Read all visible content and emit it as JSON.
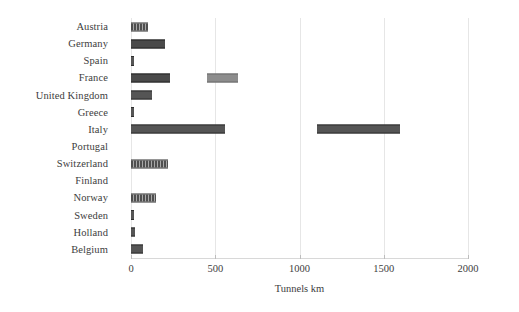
{
  "chart_data": {
    "type": "bar",
    "orientation": "horizontal",
    "title": "",
    "xlabel": "Tunnels km",
    "ylabel": "",
    "xlim": [
      0,
      2000
    ],
    "xticks": [
      0,
      500,
      1000,
      1500,
      2000
    ],
    "xtick_labels": [
      "0",
      "500",
      "1000",
      "1500",
      "2000"
    ],
    "grid": true,
    "grid_axis": "x",
    "legend": "none",
    "categories": [
      "Austria",
      "Germany",
      "Spain",
      "France",
      "United Kingdom",
      "Greece",
      "Italy",
      "Portugal",
      "Switzerland",
      "Finland",
      "Norway",
      "Sweden",
      "Holland",
      "Belgium"
    ],
    "values": [
      100,
      200,
      15,
      635,
      125,
      15,
      1596,
      0,
      220,
      0,
      150,
      15,
      25,
      70
    ],
    "bars": [
      {
        "category": "Austria",
        "total": 100,
        "segments": [
          {
            "start": 0,
            "end": 100,
            "style": "hatch"
          }
        ]
      },
      {
        "category": "Germany",
        "total": 200,
        "segments": [
          {
            "start": 0,
            "end": 200,
            "style": "dark"
          }
        ]
      },
      {
        "category": "Spain",
        "total": 15,
        "segments": [
          {
            "start": 0,
            "end": 15,
            "style": "mid"
          }
        ]
      },
      {
        "category": "France",
        "total": 635,
        "segments": [
          {
            "start": 0,
            "end": 232,
            "style": "dark"
          },
          {
            "start": 451,
            "end": 635,
            "style": "light"
          }
        ]
      },
      {
        "category": "United Kingdom",
        "total": 125,
        "segments": [
          {
            "start": 0,
            "end": 125,
            "style": "mid"
          }
        ]
      },
      {
        "category": "Greece",
        "total": 15,
        "segments": [
          {
            "start": 0,
            "end": 15,
            "style": "mid"
          }
        ]
      },
      {
        "category": "Italy",
        "total": 1596,
        "segments": [
          {
            "start": 0,
            "end": 558,
            "style": "mid"
          },
          {
            "start": 1104,
            "end": 1596,
            "style": "mid"
          }
        ]
      },
      {
        "category": "Portugal",
        "total": 0,
        "segments": []
      },
      {
        "category": "Switzerland",
        "total": 220,
        "segments": [
          {
            "start": 0,
            "end": 220,
            "style": "hatch"
          }
        ]
      },
      {
        "category": "Finland",
        "total": 0,
        "segments": []
      },
      {
        "category": "Norway",
        "total": 150,
        "segments": [
          {
            "start": 0,
            "end": 150,
            "style": "hatch"
          }
        ]
      },
      {
        "category": "Sweden",
        "total": 15,
        "segments": [
          {
            "start": 0,
            "end": 15,
            "style": "mid"
          }
        ]
      },
      {
        "category": "Holland",
        "total": 25,
        "segments": [
          {
            "start": 0,
            "end": 25,
            "style": "mid"
          }
        ]
      },
      {
        "category": "Belgium",
        "total": 70,
        "segments": [
          {
            "start": 0,
            "end": 70,
            "style": "mid"
          }
        ]
      }
    ],
    "colors": {
      "bar_mid": "#555555",
      "bar_dark": "#4a4a4a",
      "bar_light": "#8d8d8d",
      "grid": "#e6e6e6",
      "axis": "#d8d8d8",
      "text": "#3d3d3d",
      "background": "#ffffff"
    }
  }
}
